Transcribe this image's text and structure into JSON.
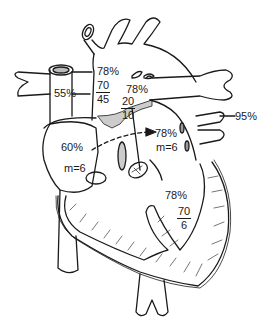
{
  "diagram": {
    "type": "heart-anatomy-hemodynamics",
    "colors": {
      "stroke": "#1a1a1a",
      "shade": "#cccccc",
      "background": "#ffffff"
    },
    "labels": {
      "svc_saturation": "55%",
      "aorta_saturation": "78%",
      "aorta_pressure": {
        "systolic": "70",
        "diastolic": "45"
      },
      "pulmonary_artery_saturation": "78%",
      "pulmonary_artery_pressure": {
        "systolic": "20",
        "diastolic": "10"
      },
      "pulmonary_vein_saturation": "95%",
      "right_atrium_saturation": "60%",
      "right_atrium_mean": "m=6",
      "left_atrium_saturation": "78%",
      "left_atrium_mean": "m=6",
      "ventricle_saturation": "78%",
      "ventricle_pressure": {
        "systolic": "70",
        "diastolic": "6"
      }
    }
  }
}
